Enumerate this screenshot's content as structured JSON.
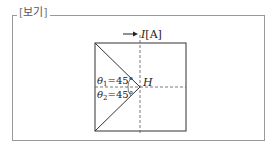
{
  "box_label": "보기",
  "current_label": "I[A]",
  "current_symbol": "I",
  "current_unit": "[A]",
  "point_label": "H",
  "angles": [
    {
      "symbol": "θ",
      "sub": "1",
      "value": "=45°"
    },
    {
      "symbol": "θ",
      "sub": "2",
      "value": "=45°"
    }
  ]
}
